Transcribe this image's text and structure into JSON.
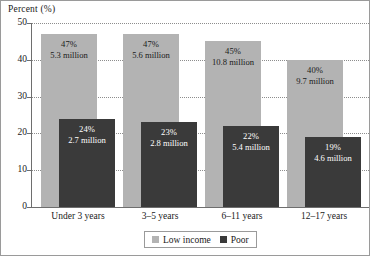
{
  "chart_data": {
    "type": "bar",
    "title": "",
    "subtitle": "",
    "xlabel": "",
    "ylabel": "Percent (%)",
    "ylim": [
      0,
      50
    ],
    "yticks": [
      0,
      10,
      20,
      30,
      40,
      50
    ],
    "grid": true,
    "legend_position": "bottom",
    "categories": [
      "Under 3 years",
      "3–5 years",
      "6–11 years",
      "12–17 years"
    ],
    "series": [
      {
        "name": "Low income",
        "color": "#b3b3b3",
        "values": [
          47,
          47,
          45,
          40
        ],
        "labels_pct": [
          "47%",
          "47%",
          "45%",
          "40%"
        ],
        "labels_count": [
          "5.3 million",
          "5.6 million",
          "10.8 million",
          "9.7 million"
        ]
      },
      {
        "name": "Poor",
        "color": "#3a3a3a",
        "values": [
          24,
          23,
          22,
          19
        ],
        "labels_pct": [
          "24%",
          "23%",
          "22%",
          "19%"
        ],
        "labels_count": [
          "2.7 million",
          "2.8 million",
          "5.4 million",
          "4.6 million"
        ]
      }
    ]
  },
  "axis": {
    "y_title": "Percent (%)",
    "ticks": [
      "50",
      "40",
      "30",
      "20",
      "10",
      "0"
    ]
  },
  "legend": {
    "items": [
      {
        "label": "Low income",
        "swatch": "low"
      },
      {
        "label": "Poor",
        "swatch": "poor"
      }
    ]
  },
  "colors": {
    "low_income": "#b3b3b3",
    "poor": "#3a3a3a",
    "grid": "#8d8d8d",
    "axis": "#6e6e6e",
    "text": "#1a1a1a",
    "frame": "#9a9a9a"
  }
}
